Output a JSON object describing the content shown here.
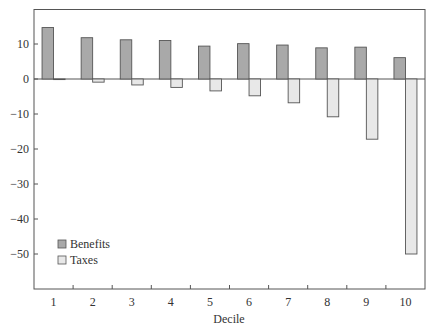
{
  "chart_data": {
    "type": "bar",
    "title": "",
    "xlabel": "Decile",
    "ylabel": "",
    "categories": [
      "1",
      "2",
      "3",
      "4",
      "5",
      "6",
      "7",
      "8",
      "9",
      "10"
    ],
    "series": [
      {
        "name": "Benefits",
        "color": "#a9a9a9",
        "values": [
          14.7,
          11.8,
          11.2,
          11.0,
          9.4,
          10.1,
          9.7,
          8.9,
          9.1,
          6.1
        ]
      },
      {
        "name": "Taxes",
        "color": "#e8e8e8",
        "values": [
          -0.1,
          -0.9,
          -1.7,
          -2.4,
          -3.4,
          -4.8,
          -6.8,
          -10.8,
          -17.2,
          -50.0
        ]
      }
    ],
    "ylim": [
      -60,
      20
    ],
    "yticks": [
      10,
      0,
      -10,
      -20,
      -30,
      -40,
      -50
    ],
    "ytick_labels": [
      "10",
      "0",
      "−10",
      "−20",
      "−30",
      "−40",
      "−50"
    ],
    "grid": false,
    "legend_position": "lower left (inside plot)"
  },
  "colors": {
    "outline": "#555555",
    "benefits": "#a9a9a9",
    "taxes": "#e8e8e8"
  }
}
